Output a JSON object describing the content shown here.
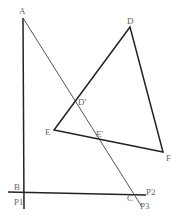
{
  "diagram": {
    "type": "geometry",
    "colors": {
      "background": "#ffffff",
      "line": "#333333",
      "label": "#666666"
    },
    "points": {
      "A": {
        "label": "A",
        "x": 23,
        "y": 18
      },
      "B": {
        "label": "B",
        "x": 24,
        "y": 193
      },
      "C": {
        "label": "C",
        "x": 133,
        "y": 194
      },
      "D": {
        "label": "D",
        "x": 130,
        "y": 27
      },
      "E": {
        "label": "E",
        "x": 54,
        "y": 130
      },
      "F": {
        "label": "F",
        "x": 163,
        "y": 152
      },
      "Dp": {
        "label": "D'",
        "x": 74,
        "y": 103
      },
      "Ep": {
        "label": "E'",
        "x": 96,
        "y": 138
      },
      "P1": {
        "label": "P1",
        "x": 24,
        "y": 208
      },
      "P2": {
        "label": "P2",
        "x": 146,
        "y": 195
      },
      "P3": {
        "label": "P3",
        "x": 141,
        "y": 206
      }
    },
    "segments": [
      {
        "from": "A",
        "to": "P1",
        "style": "thick"
      },
      {
        "from": "A",
        "to": "P3",
        "style": "thin"
      },
      {
        "from": "B",
        "to": "P2",
        "style": "thick"
      },
      {
        "from": "D",
        "to": "E",
        "style": "thick"
      },
      {
        "from": "E",
        "to": "F",
        "style": "thick"
      },
      {
        "from": "F",
        "to": "D",
        "style": "thick"
      }
    ]
  }
}
